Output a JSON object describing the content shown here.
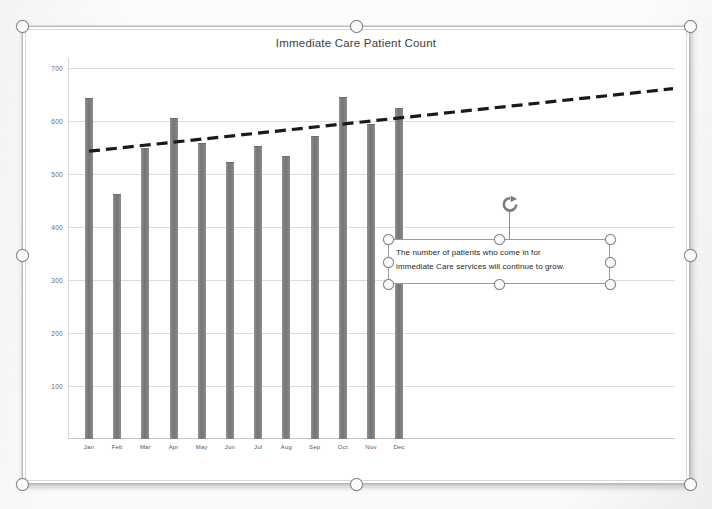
{
  "chart_data": {
    "type": "bar",
    "title": "Immediate Care Patient Count",
    "xlabel": "",
    "ylabel": "",
    "categories": [
      "Jan",
      "Feb",
      "Mar",
      "Apr",
      "May",
      "Jun",
      "Jul",
      "Aug",
      "Sep",
      "Oct",
      "Nov",
      "Dec"
    ],
    "values": [
      642,
      461,
      547,
      603,
      556,
      521,
      551,
      532,
      569,
      643,
      593,
      622
    ],
    "series": [
      {
        "name": "Patient Count",
        "values": [
          642,
          461,
          547,
          603,
          556,
          521,
          551,
          532,
          569,
          643,
          593,
          622
        ]
      }
    ],
    "ylim": [
      0,
      700
    ],
    "ytick_labels": [
      "700",
      "600",
      "500",
      "400",
      "300",
      "200",
      "100"
    ],
    "ytick_values": [
      700,
      600,
      500,
      400,
      300,
      200,
      100
    ],
    "grid": true,
    "legend": "none",
    "bar_color": "#7a7a7a",
    "trendline": {
      "type": "linear",
      "style": "dashed",
      "color": "#1a1a1a",
      "start_value": 543,
      "end_value": 661,
      "extends_past_last_category": true
    }
  },
  "chart_object": {
    "name": "chart-selection",
    "selected": true,
    "handle_count": 8
  },
  "textbox": {
    "line1": "The number of patients who come in for",
    "line2": "immediate Care services will continue to grow.",
    "selected": true,
    "handle_count": 8,
    "rotate_icon": "rotate-icon"
  },
  "colors": {
    "bar": "#7a7a7a",
    "trendline": "#1a1a1a",
    "gridline": "#dcdcdc",
    "frame_border": "#b9b9b9",
    "handle_fill": "#fbfbfb",
    "handle_stroke": "#7d7d7d"
  }
}
